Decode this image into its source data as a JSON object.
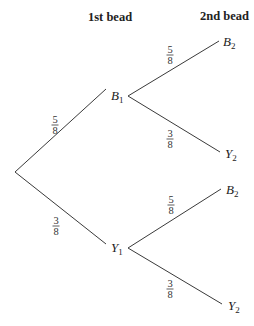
{
  "headers": {
    "first": "1st bead",
    "second": "2nd bead"
  },
  "nodes": {
    "b1": {
      "letter": "B",
      "sub": "1"
    },
    "y1": {
      "letter": "Y",
      "sub": "1"
    },
    "b2_top": {
      "letter": "B",
      "sub": "2"
    },
    "y2_top": {
      "letter": "Y",
      "sub": "2"
    },
    "b2_bottom": {
      "letter": "B",
      "sub": "2"
    },
    "y2_bottom": {
      "letter": "Y",
      "sub": "2"
    }
  },
  "edges": {
    "root_b1": {
      "num": "5",
      "den": "8"
    },
    "root_y1": {
      "num": "3",
      "den": "8"
    },
    "b1_b2": {
      "num": "5",
      "den": "8"
    },
    "b1_y2": {
      "num": "3",
      "den": "8"
    },
    "y1_b2": {
      "num": "5",
      "den": "8"
    },
    "y1_y2": {
      "num": "3",
      "den": "8"
    }
  }
}
